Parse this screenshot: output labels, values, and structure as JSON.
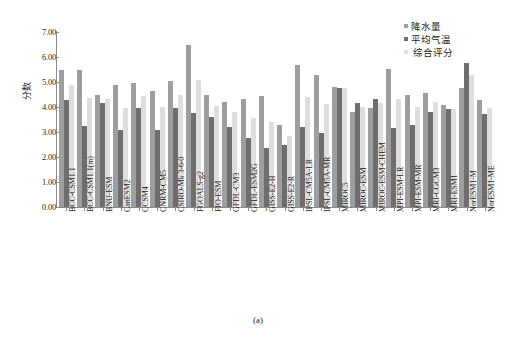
{
  "chart_data": {
    "type": "bar",
    "title": "",
    "caption": "(a)",
    "xlabel": "",
    "ylabel": "分数",
    "ylim": [
      0.0,
      7.0
    ],
    "yticks": [
      "0.00",
      "1.00",
      "2.00",
      "3.00",
      "4.00",
      "5.00",
      "6.00",
      "7.00"
    ],
    "ytick_values": [
      0,
      1,
      2,
      3,
      4,
      5,
      6,
      7
    ],
    "grid": false,
    "legend_position": "top-right",
    "categories": [
      "BCC-CSM1.1",
      "BCC-CSM1.1(m)",
      "BNU-ESM",
      "CanESM2",
      "CCSM4",
      "CNRM-CM5",
      "CSIRO-Mk 3-6-0",
      "FGOALS-g2",
      "FIO-ESM",
      "GFDL-CM3",
      "GFDL-ESM2G",
      "GISS-E2-H",
      "GISS-E2-R",
      "IPSL-CM5A-LR",
      "IPSL-CM5A-MR",
      "MIROC5",
      "MIROC-ESM",
      "MIROC-ESM-CHEM",
      "MPI-ESM-LR",
      "MPI-ESM-MR",
      "MRI-CGCM3",
      "MRI-ESM1",
      "NorESM1-M",
      "NorESM1-ME"
    ],
    "series": [
      {
        "name": "降水量",
        "color": "#9e9e9e",
        "values": [
          5.5,
          5.5,
          4.5,
          4.9,
          4.95,
          4.65,
          5.05,
          6.5,
          4.5,
          4.2,
          4.33,
          4.43,
          3.27,
          5.68,
          5.28,
          4.8,
          3.82,
          3.96,
          5.53,
          4.47,
          4.58,
          4.08,
          4.75,
          4.28
        ]
      },
      {
        "name": "平均气温",
        "color": "#6e6e6e",
        "values": [
          4.3,
          3.25,
          4.17,
          3.08,
          3.96,
          3.09,
          3.95,
          3.78,
          3.62,
          3.2,
          2.78,
          2.35,
          2.47,
          3.2,
          2.98,
          4.78,
          4.18,
          4.33,
          3.18,
          3.27,
          3.82,
          3.92,
          5.78,
          3.71
        ]
      },
      {
        "name": "综合评分",
        "color": "#dedede",
        "values": [
          4.9,
          4.37,
          4.32,
          3.98,
          4.44,
          4.01,
          4.47,
          5.1,
          4.05,
          3.8,
          3.57,
          3.41,
          2.85,
          4.42,
          4.11,
          4.77,
          4.0,
          4.15,
          4.32,
          4.02,
          4.19,
          3.92,
          5.28,
          3.98
        ]
      }
    ]
  },
  "legend": {
    "items": [
      {
        "label": "降水量"
      },
      {
        "label": "平均气温"
      },
      {
        "label": "综合评分"
      }
    ]
  }
}
